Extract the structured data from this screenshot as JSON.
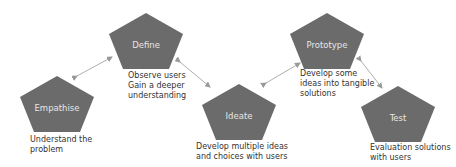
{
  "colors": {
    "pentagon": "#6b6b6b",
    "label": "#e6e6e6",
    "text": "#333333",
    "arrow": "#999999"
  },
  "nodes": [
    {
      "id": "empathise",
      "label": "Empathise",
      "description": [
        "Understand the",
        "problem"
      ]
    },
    {
      "id": "define",
      "label": "Define",
      "description": [
        "Observe users",
        "Gain a deeper",
        "understanding"
      ]
    },
    {
      "id": "ideate",
      "label": "Ideate",
      "description": [
        "Develop multiple ideas",
        "and choices with users"
      ]
    },
    {
      "id": "prototype",
      "label": "Prototype",
      "description": [
        "Develop some",
        "ideas into tangible",
        "solutions"
      ]
    },
    {
      "id": "test",
      "label": "Test",
      "description": [
        "Evaluation solutions",
        "with users"
      ]
    }
  ],
  "connections": [
    {
      "from": "empathise",
      "to": "define",
      "type": "bidirectional"
    },
    {
      "from": "define",
      "to": "ideate",
      "type": "bidirectional"
    },
    {
      "from": "ideate",
      "to": "prototype",
      "type": "bidirectional"
    },
    {
      "from": "prototype",
      "to": "test",
      "type": "bidirectional"
    }
  ]
}
